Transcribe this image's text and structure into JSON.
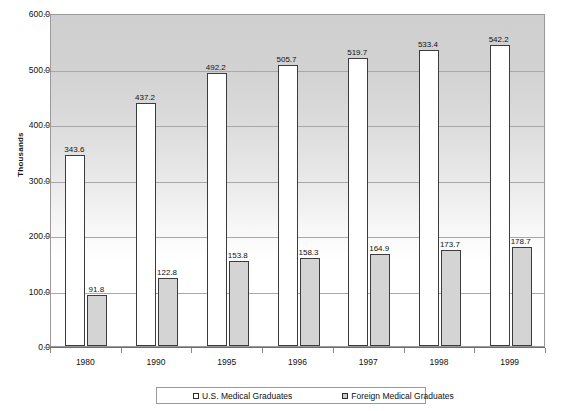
{
  "chart_data": {
    "type": "bar",
    "title": "",
    "xlabel": "",
    "ylabel": "Thousands",
    "ylim": [
      0.0,
      600.0
    ],
    "ytick_labels": [
      "600.0",
      "500.0",
      "400.0",
      "300.0",
      "200.0",
      "100.0",
      "0.0"
    ],
    "ytick_values": [
      600.0,
      500.0,
      400.0,
      300.0,
      200.0,
      100.0,
      0.0
    ],
    "grid": true,
    "legend_position": "bottom",
    "categories": [
      "1980",
      "1990",
      "1995",
      "1996",
      "1997",
      "1998",
      "1999"
    ],
    "series": [
      {
        "name": "U.S. Medical Graduates",
        "color": "#ffffff",
        "values": [
          343.6,
          437.2,
          492.2,
          505.7,
          519.7,
          533.4,
          542.2
        ],
        "labels": [
          "343.6",
          "437.2",
          "492.2",
          "505.7",
          "519.7",
          "533.4",
          "542.2"
        ]
      },
      {
        "name": "Foreign Medical Graduates",
        "color": "#d4d4d4",
        "values": [
          91.8,
          122.8,
          153.8,
          158.3,
          164.9,
          173.7,
          178.7
        ],
        "labels": [
          "91.8",
          "122.8",
          "153.8",
          "158.3",
          "164.9",
          "173.7",
          "178.7"
        ]
      }
    ]
  },
  "legend": {
    "items": [
      {
        "label": "U.S. Medical Graduates",
        "swatch": "us"
      },
      {
        "label": "Foreign Medical Graduates",
        "swatch": "fmg"
      }
    ]
  }
}
